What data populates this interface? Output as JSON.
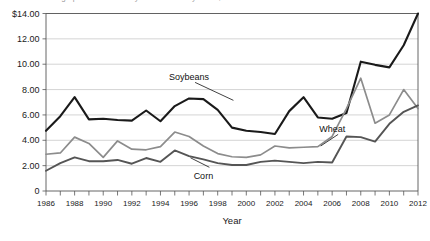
{
  "chart_data": {
    "type": "line",
    "title": "Average prices received by farmers for soybeans, corn and wheat",
    "xlabel": "Year",
    "ylabel": "",
    "x": [
      1986,
      1987,
      1988,
      1989,
      1990,
      1991,
      1992,
      1993,
      1994,
      1995,
      1996,
      1997,
      1998,
      1999,
      2000,
      2001,
      2002,
      2003,
      2004,
      2005,
      2006,
      2007,
      2008,
      2009,
      2010,
      2011,
      2012
    ],
    "xlim": [
      1986,
      2012
    ],
    "ylim": [
      0,
      14
    ],
    "yticks": [
      0,
      2,
      4,
      6,
      8,
      10,
      12,
      14
    ],
    "ytick_labels": [
      "0",
      "2.00",
      "4.00",
      "6.00",
      "8.00",
      "10.00",
      "12.00",
      "$14.00"
    ],
    "xtick_labels": [
      "1986",
      "1988",
      "1990",
      "1992",
      "1994",
      "1996",
      "1998",
      "2000",
      "2002",
      "2004",
      "2006",
      "2008",
      "2010",
      "2012"
    ],
    "xtick_step": 2,
    "minor_xticks_every": 1,
    "grid": "horizontal",
    "legend": "inline-annotations",
    "currency": "$",
    "series": [
      {
        "name": "Soybeans",
        "color": "#1a1a1a",
        "width": 2.1,
        "values": [
          4.75,
          5.9,
          7.4,
          5.65,
          5.7,
          5.6,
          5.55,
          6.35,
          5.5,
          6.7,
          7.3,
          7.25,
          6.4,
          5.0,
          4.75,
          4.65,
          4.5,
          6.3,
          7.4,
          5.8,
          5.7,
          6.15,
          10.2,
          9.95,
          9.75,
          11.5,
          14.0
        ]
      },
      {
        "name": "Wheat",
        "color": "#8c8c8c",
        "width": 1.7,
        "values": [
          2.9,
          3.0,
          4.25,
          3.75,
          2.65,
          3.95,
          3.3,
          3.25,
          3.5,
          4.65,
          4.3,
          3.55,
          2.95,
          2.7,
          2.65,
          2.85,
          3.55,
          3.4,
          3.45,
          3.5,
          4.3,
          6.5,
          8.9,
          5.35,
          6.0,
          8.0,
          6.5
        ]
      },
      {
        "name": "Corn",
        "color": "#555555",
        "width": 1.9,
        "values": [
          1.6,
          2.2,
          2.65,
          2.35,
          2.35,
          2.45,
          2.15,
          2.6,
          2.3,
          3.2,
          2.75,
          2.5,
          2.2,
          2.05,
          2.05,
          2.3,
          2.4,
          2.3,
          2.2,
          2.3,
          2.25,
          4.3,
          4.25,
          3.9,
          5.3,
          6.25,
          6.75
        ]
      }
    ],
    "annotations": [
      {
        "text": "Soybeans",
        "x": 1996,
        "y": 9.0
      },
      {
        "text": "Wheat",
        "x": 2006,
        "y": 4.9
      },
      {
        "text": "Corn",
        "x": 1997,
        "y": 1.2
      }
    ]
  }
}
